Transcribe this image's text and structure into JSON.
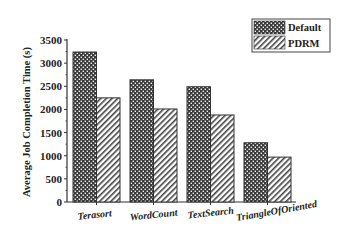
{
  "chart_data": {
    "type": "bar",
    "title": "",
    "xlabel": "",
    "ylabel": "Average Job Completion Time (s)",
    "ylim": [
      0,
      3500
    ],
    "yticks": [
      0,
      500,
      1000,
      1500,
      2000,
      2500,
      3000,
      3500
    ],
    "categories": [
      "Terasort",
      "WordCount",
      "TextSearch",
      "TriangleOfOriented"
    ],
    "series": [
      {
        "name": "Default",
        "pattern": "crosshatch-dots",
        "values": [
          3240,
          2640,
          2490,
          1280
        ]
      },
      {
        "name": "PDRM",
        "pattern": "diagonal-stripes",
        "values": [
          2250,
          2010,
          1880,
          970
        ]
      }
    ],
    "grid": false,
    "legend_position": "top-right"
  },
  "colors": {
    "axis": "#333333",
    "bar_outline": "#333333",
    "default_fill": "#3a3a3a",
    "pdrm_stripe": "#444444"
  }
}
